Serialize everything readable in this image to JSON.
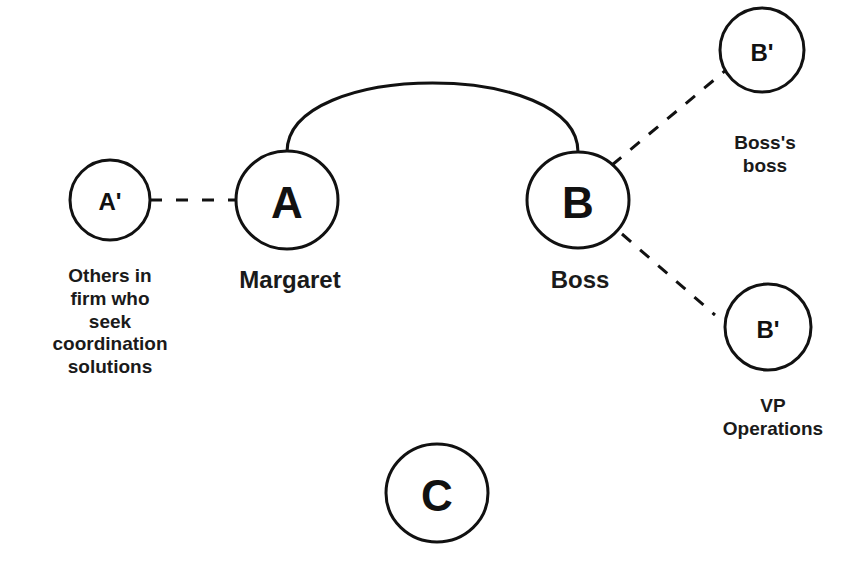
{
  "diagram": {
    "nodes": [
      {
        "id": "a-prime",
        "letter": "A'",
        "label": "Others in firm who seek coordination solutions",
        "label_lines": [
          "Others in",
          "firm who",
          "seek",
          "coordination",
          "solutions"
        ]
      },
      {
        "id": "a",
        "letter": "A",
        "label": "Margaret"
      },
      {
        "id": "b",
        "letter": "B",
        "label": "Boss"
      },
      {
        "id": "b-prime-top",
        "letter": "B'",
        "label": "Boss's boss",
        "label_lines": [
          "Boss's",
          "boss"
        ]
      },
      {
        "id": "b-prime-bottom",
        "letter": "B'",
        "label": "VP Operations",
        "label_lines": [
          "VP",
          "Operations"
        ]
      },
      {
        "id": "c",
        "letter": "C",
        "label": ""
      }
    ],
    "edges": [
      {
        "from": "a",
        "to": "b",
        "style": "solid-arc"
      },
      {
        "from": "a-prime",
        "to": "a",
        "style": "dashed"
      },
      {
        "from": "b",
        "to": "b-prime-top",
        "style": "dashed"
      },
      {
        "from": "b",
        "to": "b-prime-bottom",
        "style": "dashed"
      }
    ],
    "colors": {
      "stroke": "#111111",
      "background": "#ffffff"
    }
  }
}
